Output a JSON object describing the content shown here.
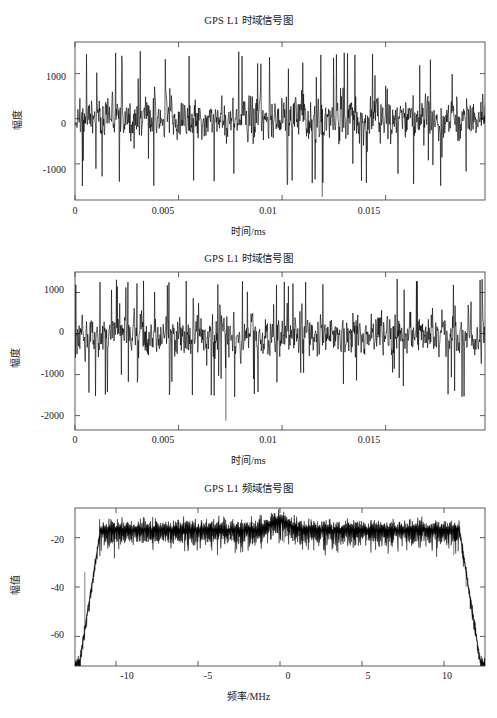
{
  "figure": {
    "background_color": "#ffffff",
    "axis_color": "#4a4a4a",
    "trace_color": "#000000",
    "width": 497,
    "height": 718
  },
  "panels": [
    {
      "id": "panel-1",
      "title": "GPS L1 时域信号图",
      "ylabel": "幅度",
      "xlabel": "时间/ms",
      "y_ticks": [
        "1000",
        "0",
        "-1000"
      ],
      "x_ticks": [
        "0",
        "0.005",
        "0.01",
        "0.015"
      ]
    },
    {
      "id": "panel-2",
      "title": "GPS L1 时域信号图",
      "ylabel": "幅度",
      "xlabel": "时间/ms",
      "y_ticks": [
        "1000",
        "0",
        "-1000",
        "-2000"
      ],
      "x_ticks": [
        "0",
        "0.005",
        "0.01",
        "0.015"
      ]
    },
    {
      "id": "panel-3",
      "title": "GPS L1 频域信号图",
      "ylabel": "幅值",
      "xlabel": "频率/MHz",
      "y_ticks": [
        "-20",
        "-40",
        "-60"
      ],
      "x_ticks": [
        "-10",
        "-5",
        "0",
        "5",
        "10"
      ]
    }
  ],
  "chart_data": [
    {
      "type": "line",
      "title": "GPS L1 时域信号图",
      "xlabel": "时间/ms",
      "ylabel": "幅度",
      "xlim": [
        0,
        0.0198
      ],
      "ylim": [
        -1750,
        1650
      ],
      "x_ticks": [
        0,
        0.005,
        0.01,
        0.015
      ],
      "y_ticks": [
        1000,
        0,
        -1000
      ],
      "grid": false,
      "legend": null,
      "description": "GPS L1 time-domain sampled signal: dense zero-mean noise-like waveform, amplitude envelope roughly ±1500 with occasional spikes to -1750.",
      "series": [
        {
          "name": "GPS L1 time domain",
          "color": "#000000",
          "n_samples": 900,
          "rms_amplitude": 520,
          "peak_positive": 1600,
          "peak_negative": -1720,
          "mean": 0
        }
      ]
    },
    {
      "type": "line",
      "title": "GPS L1 时域信号图",
      "xlabel": "时间/ms",
      "ylabel": "幅度",
      "xlim": [
        0,
        0.0198
      ],
      "ylim": [
        -2300,
        1500
      ],
      "x_ticks": [
        0,
        0.005,
        0.01,
        0.015
      ],
      "y_ticks": [
        1000,
        0,
        -1000,
        -2000
      ],
      "grid": false,
      "legend": null,
      "description": "Second GPS L1 time-domain record: similar dense noise-like waveform, slightly negative-skewed with a deep spike reaching about -2100 near t = 0.0073 ms.",
      "series": [
        {
          "name": "GPS L1 time domain (2)",
          "color": "#000000",
          "n_samples": 900,
          "rms_amplitude": 540,
          "peak_positive": 1350,
          "peak_negative": -2100,
          "mean": -30
        }
      ]
    },
    {
      "type": "line",
      "title": "GPS L1 频域信号图",
      "xlabel": "频率/MHz",
      "ylabel": "幅值",
      "xlim": [
        -12.5,
        12.5
      ],
      "ylim": [
        -72,
        -8
      ],
      "x_ticks": [
        -10,
        -5,
        0,
        5,
        10
      ],
      "y_ticks": [
        -20,
        -40,
        -60
      ],
      "grid": false,
      "legend": null,
      "description": "GPS L1 power spectrum in dB: flat noisy passband near -17 dB spanning about -11 to +11 MHz, a small +4 dB bump at 0 MHz (carrier), steep roll-off beyond ±11 MHz down below -65 dB at the band edges.",
      "series": [
        {
          "name": "GPS L1 spectrum",
          "color": "#000000",
          "passband_level_db": -17,
          "passband_edges_mhz": [
            -11.2,
            11.2
          ],
          "center_peak_db": -13,
          "center_peak_freq_mhz": 0,
          "noise_ripple_db": 3.5,
          "edge_floor_db": -70,
          "points": [
            {
              "f": -12.5,
              "db": -70
            },
            {
              "f": -12.0,
              "db": -62
            },
            {
              "f": -11.6,
              "db": -48
            },
            {
              "f": -11.3,
              "db": -32
            },
            {
              "f": -11.0,
              "db": -20
            },
            {
              "f": -10.5,
              "db": -17
            },
            {
              "f": -8.0,
              "db": -17
            },
            {
              "f": -5.0,
              "db": -17
            },
            {
              "f": -2.0,
              "db": -17
            },
            {
              "f": -0.6,
              "db": -15
            },
            {
              "f": 0.0,
              "db": -13
            },
            {
              "f": 0.6,
              "db": -15
            },
            {
              "f": 2.0,
              "db": -17
            },
            {
              "f": 5.0,
              "db": -17
            },
            {
              "f": 8.0,
              "db": -17
            },
            {
              "f": 10.5,
              "db": -17
            },
            {
              "f": 11.0,
              "db": -20
            },
            {
              "f": 11.4,
              "db": -34
            },
            {
              "f": 11.8,
              "db": -50
            },
            {
              "f": 12.2,
              "db": -63
            },
            {
              "f": 12.5,
              "db": -71
            }
          ]
        }
      ]
    }
  ]
}
